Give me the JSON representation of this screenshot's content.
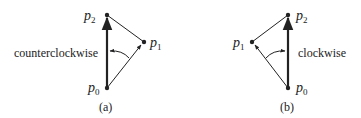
{
  "diagrams": [
    {
      "id": "a",
      "caption": "(a)",
      "direction_label": "counterclockwise",
      "points": {
        "p0": {
          "label": "p",
          "sub": "0"
        },
        "p1": {
          "label": "p",
          "sub": "1"
        },
        "p2": {
          "label": "p",
          "sub": "2"
        }
      }
    },
    {
      "id": "b",
      "caption": "(b)",
      "direction_label": "clockwise",
      "points": {
        "p0": {
          "label": "p",
          "sub": "0"
        },
        "p1": {
          "label": "p",
          "sub": "1"
        },
        "p2": {
          "label": "p",
          "sub": "2"
        }
      }
    }
  ],
  "colors": {
    "stroke": "#222222",
    "background": "#ffffff"
  }
}
